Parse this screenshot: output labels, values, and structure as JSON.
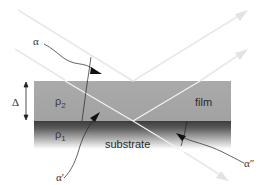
{
  "diagram": {
    "type": "thin-film reflection schematic",
    "labels": {
      "alpha_incident": "α",
      "alpha_prime": "α′",
      "alpha_double_prime": "α″",
      "thickness": "Δ",
      "rho_film": "ρ",
      "rho_film_sub": "2",
      "rho_substrate": "ρ",
      "rho_substrate_sub": "1",
      "film": "film",
      "substrate": "substrate"
    },
    "colors": {
      "film_fill": "#a9a9a9",
      "substrate_top": "#3c3c3c",
      "substrate_bottom": "#ffffff",
      "ray": "#f0f0f0",
      "ray_outside": "#e6e6e6",
      "annotation": "#222222"
    },
    "geometry": {
      "film": {
        "x": 34,
        "y": 81,
        "width": 197,
        "height": 40
      },
      "substrate": {
        "x": 34,
        "y": 121,
        "width": 197,
        "height": 28
      },
      "rays": [
        {
          "name": "upper-incident",
          "from": [
            18,
            10
          ],
          "to": [
            133,
            81
          ]
        },
        {
          "name": "upper-reflected",
          "from": [
            133,
            81
          ],
          "to": [
            247,
            11
          ]
        },
        {
          "name": "lower-incident",
          "from": [
            15,
            49
          ],
          "to": [
            133,
            121
          ]
        },
        {
          "name": "interface-reflected",
          "from": [
            133,
            121
          ],
          "to": [
            247,
            50
          ]
        },
        {
          "name": "transmitted",
          "from": [
            133,
            121
          ],
          "to": [
            228,
            180
          ]
        }
      ]
    }
  }
}
